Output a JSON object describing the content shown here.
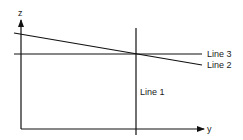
{
  "diagram": {
    "axes": {
      "z_label": "z",
      "y_label": "y"
    },
    "lines": [
      {
        "id": "line1",
        "label": "Line 1",
        "orientation": "vertical"
      },
      {
        "id": "line2",
        "label": "Line 2",
        "orientation": "sloped-down"
      },
      {
        "id": "line3",
        "label": "Line 3",
        "orientation": "horizontal"
      }
    ],
    "colors": {
      "stroke": "#111111",
      "background": "#ffffff"
    }
  }
}
